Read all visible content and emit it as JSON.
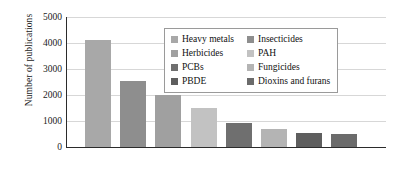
{
  "chart_data": {
    "type": "bar",
    "title": "",
    "xlabel": "",
    "ylabel": "Number of publications",
    "ylim": [
      0,
      5000
    ],
    "yticks": [
      0,
      1000,
      2000,
      3000,
      4000,
      5000
    ],
    "ytick_labels": [
      "0",
      "1000",
      "2000",
      "3000",
      "4000",
      "5000"
    ],
    "grid": true,
    "legend_position": "upper-center",
    "categories": [
      "Heavy metals",
      "Insecticides",
      "Herbicides",
      "PAH",
      "PCBs",
      "Fungicides",
      "PBDE",
      "Dioxins and furans"
    ],
    "values": [
      4100,
      2520,
      1980,
      1500,
      900,
      680,
      520,
      470
    ],
    "colors": [
      "#a8a8a8",
      "#8e8e8e",
      "#a0a0a0",
      "#c2c2c2",
      "#6f6f6f",
      "#b4b4b4",
      "#5e5e5e",
      "#6b6b6b"
    ]
  },
  "legend": {
    "items": [
      {
        "label": "Heavy metals",
        "color": "#a8a8a8"
      },
      {
        "label": "Insecticides",
        "color": "#8e8e8e"
      },
      {
        "label": "Herbicides",
        "color": "#a0a0a0"
      },
      {
        "label": "PAH",
        "color": "#c2c2c2"
      },
      {
        "label": "PCBs",
        "color": "#6f6f6f"
      },
      {
        "label": "Fungicides",
        "color": "#b4b4b4"
      },
      {
        "label": "PBDE",
        "color": "#5e5e5e"
      },
      {
        "label": "Dioxins and furans",
        "color": "#6b6b6b"
      }
    ]
  }
}
